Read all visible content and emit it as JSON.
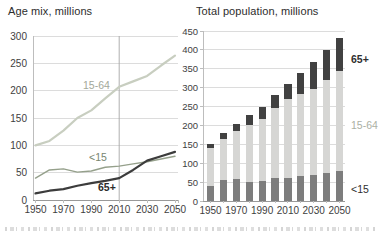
{
  "figure": {
    "left_title": "Age mix, millions",
    "right_title": "Total population, millions"
  },
  "colors": {
    "grid": "#dcdcdc",
    "baseline": "#999999",
    "axis": "#bdbdbd",
    "forecast_divider": "#a6a6a6",
    "tick_label": "#3e3e3e"
  },
  "chart_data": [
    {
      "type": "line",
      "title": "Age mix, millions",
      "x": [
        1950,
        1960,
        1970,
        1980,
        1990,
        2000,
        2010,
        2020,
        2030,
        2040,
        2050
      ],
      "series": [
        {
          "name": "15-64",
          "values": [
            100,
            108,
            127,
            150,
            164,
            186,
            207,
            217,
            227,
            246,
            264
          ],
          "color": "#c8cec0",
          "stroke_width": 2.2
        },
        {
          "name": "<15",
          "values": [
            40,
            55,
            57,
            51,
            53,
            60,
            62,
            66,
            70,
            75,
            80
          ],
          "color": "#95a08b",
          "stroke_width": 1.4
        },
        {
          "name": "65+",
          "values": [
            12,
            17,
            20,
            26,
            31,
            35,
            40,
            55,
            72,
            80,
            88
          ],
          "color": "#3c3c3c",
          "stroke_width": 2.2
        }
      ],
      "ylim": [
        0,
        300
      ],
      "yticks": [
        0,
        50,
        100,
        150,
        200,
        250,
        300
      ],
      "xticks": [
        1950,
        1970,
        1990,
        2010,
        2030,
        2050
      ],
      "forecast_divider_x": 2010,
      "grid": true,
      "annotations": [
        {
          "text": "15-64",
          "color": "#a3a89a"
        },
        {
          "text": "<15",
          "color": "#78856f"
        },
        {
          "text": "65+",
          "color": "#2b2b2b"
        }
      ]
    },
    {
      "type": "bar",
      "title": "Total population, millions",
      "categories": [
        1950,
        1960,
        1970,
        1980,
        1990,
        2000,
        2010,
        2020,
        2030,
        2040,
        2050
      ],
      "series": [
        {
          "name": "<15",
          "values": [
            40,
            55,
            57,
            51,
            53,
            60,
            62,
            66,
            70,
            75,
            80
          ],
          "color": "#7d7d7d"
        },
        {
          "name": "15-64",
          "values": [
            100,
            108,
            127,
            150,
            164,
            186,
            207,
            217,
            227,
            246,
            264
          ],
          "color": "#d6d6d4"
        },
        {
          "name": "65+",
          "values": [
            12,
            17,
            20,
            26,
            31,
            35,
            40,
            55,
            72,
            80,
            88
          ],
          "color": "#414141"
        }
      ],
      "ylim": [
        0,
        450
      ],
      "yticks": [
        0,
        50,
        100,
        150,
        200,
        250,
        300,
        350,
        400,
        450
      ],
      "xticks": [
        1950,
        1970,
        1990,
        2010,
        2030,
        2050
      ],
      "grid": true,
      "legend": [
        {
          "text": "65+",
          "color": "#2f2f2f"
        },
        {
          "text": "15-64",
          "color": "#abb0a4"
        },
        {
          "text": "<15",
          "color": "#2f2f2f"
        }
      ]
    }
  ]
}
